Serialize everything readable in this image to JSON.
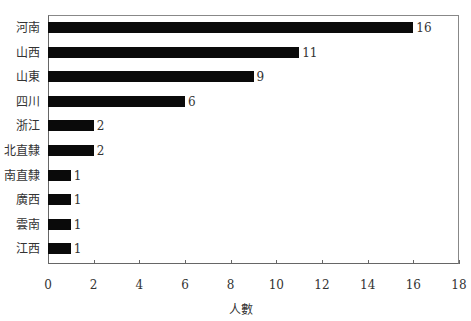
{
  "chart_data": {
    "type": "bar",
    "orientation": "horizontal",
    "title": "",
    "xlabel": "人數",
    "ylabel": "",
    "categories": [
      "河南",
      "山西",
      "山東",
      "四川",
      "浙江",
      "北直隸",
      "南直隸",
      "廣西",
      "雲南",
      "江西"
    ],
    "values": [
      16,
      11,
      9,
      6,
      2,
      2,
      1,
      1,
      1,
      1
    ],
    "value_labels": [
      "16",
      "11",
      "9",
      "6",
      "2",
      "2",
      "1",
      "1",
      "1",
      "1"
    ],
    "xlim": [
      0,
      18
    ],
    "xticks": [
      "0",
      "2",
      "4",
      "6",
      "8",
      "10",
      "12",
      "14",
      "16",
      "18"
    ],
    "grid": false,
    "legend": null,
    "bar_color": "#0a0a0a"
  }
}
